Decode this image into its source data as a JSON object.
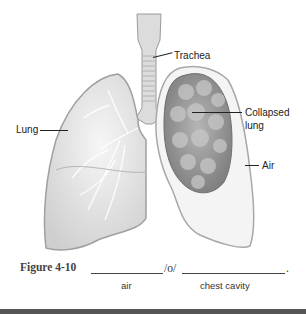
{
  "figure": {
    "labels": {
      "trachea": "Trachea",
      "lung": "Lung",
      "collapsed_lung_line1": "Collapsed",
      "collapsed_lung_line2": "lung",
      "air": "Air"
    },
    "caption": {
      "figure_number": "Figure 4-10",
      "separator": "/o/",
      "end_mark": ".",
      "blank1_hint": "air",
      "blank2_hint": "chest cavity"
    }
  }
}
